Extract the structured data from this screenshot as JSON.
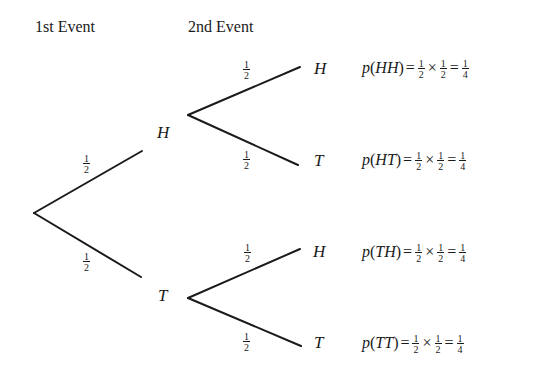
{
  "headers": {
    "first_event": "1st Event",
    "second_event": "2nd Event"
  },
  "tree": {
    "root": {
      "x": 34,
      "y": 213
    },
    "level1": [
      {
        "label": "H",
        "prob_num": "1",
        "prob_den": "2",
        "branch_end": {
          "x": 142,
          "y": 151
        },
        "node_start": {
          "x": 188,
          "y": 115
        }
      },
      {
        "label": "T",
        "prob_num": "1",
        "prob_den": "2",
        "branch_end": {
          "x": 141,
          "y": 277
        },
        "node_start": {
          "x": 188,
          "y": 298
        }
      }
    ],
    "level2": [
      {
        "parent": "H",
        "label": "H",
        "prob_num": "1",
        "prob_den": "2",
        "end": {
          "x": 300,
          "y": 67
        }
      },
      {
        "parent": "H",
        "label": "T",
        "prob_num": "1",
        "prob_den": "2",
        "end": {
          "x": 298,
          "y": 165
        }
      },
      {
        "parent": "T",
        "label": "H",
        "prob_num": "1",
        "prob_den": "2",
        "end": {
          "x": 300,
          "y": 249
        }
      },
      {
        "parent": "T",
        "label": "T",
        "prob_num": "1",
        "prob_den": "2",
        "end": {
          "x": 301,
          "y": 346
        }
      }
    ]
  },
  "outcomes": [
    {
      "p": "p",
      "open": "(",
      "event": "HH",
      "close": ")",
      "eq": "=",
      "a_num": "1",
      "a_den": "2",
      "times": "×",
      "b_num": "1",
      "b_den": "2",
      "eq2": "=",
      "r_num": "1",
      "r_den": "4"
    },
    {
      "p": "p",
      "open": "(",
      "event": "HT",
      "close": ")",
      "eq": "=",
      "a_num": "1",
      "a_den": "2",
      "times": "×",
      "b_num": "1",
      "b_den": "2",
      "eq2": "=",
      "r_num": "1",
      "r_den": "4"
    },
    {
      "p": "p",
      "open": "(",
      "event": "TH",
      "close": ")",
      "eq": "=",
      "a_num": "1",
      "a_den": "2",
      "times": "×",
      "b_num": "1",
      "b_den": "2",
      "eq2": "=",
      "r_num": "1",
      "r_den": "4"
    },
    {
      "p": "p",
      "open": "(",
      "event": "TT",
      "close": ")",
      "eq": "=",
      "a_num": "1",
      "a_den": "2",
      "times": "×",
      "b_num": "1",
      "b_den": "2",
      "eq2": "=",
      "r_num": "1",
      "r_den": "4"
    }
  ],
  "colors": {
    "ink": "#1a1a1a",
    "background": "#ffffff"
  }
}
